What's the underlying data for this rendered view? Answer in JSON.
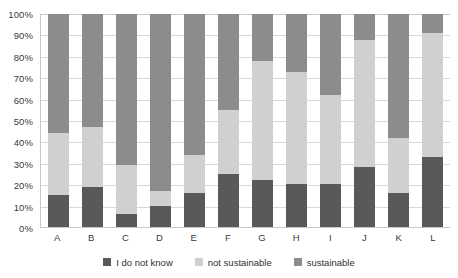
{
  "chart_data": {
    "type": "bar",
    "subtype": "stacked-percentage-bar",
    "title": "",
    "subtitle": "",
    "xlabel": "",
    "ylabel": "",
    "ylim": [
      0,
      100
    ],
    "grid": true,
    "legend_position": "bottom",
    "categories": [
      "A",
      "B",
      "C",
      "D",
      "E",
      "F",
      "G",
      "H",
      "I",
      "J",
      "K",
      "L"
    ],
    "y_ticks": [
      "0%",
      "10%",
      "20%",
      "30%",
      "40%",
      "50%",
      "60%",
      "70%",
      "80%",
      "90%",
      "100%"
    ],
    "y_tick_values": [
      0,
      10,
      20,
      30,
      40,
      50,
      60,
      70,
      80,
      90,
      100
    ],
    "series": [
      {
        "name": "I do not know",
        "color": "#595959",
        "values": [
          15,
          19,
          6,
          10,
          16,
          25,
          22,
          20,
          20,
          28,
          16,
          33
        ]
      },
      {
        "name": "not sustainable",
        "color": "#d0d0d0",
        "values": [
          29,
          28,
          23,
          7,
          18,
          30,
          56,
          53,
          42,
          60,
          26,
          58
        ]
      },
      {
        "name": "sustainable",
        "color": "#8c8c8c",
        "values": [
          56,
          53,
          71,
          83,
          66,
          45,
          22,
          27,
          38,
          12,
          58,
          9
        ]
      }
    ],
    "cumulative_boundaries": {
      "A": [
        15,
        44,
        100
      ],
      "B": [
        19,
        47,
        100
      ],
      "C": [
        6,
        29,
        100
      ],
      "D": [
        10,
        17,
        100
      ],
      "E": [
        16,
        34,
        100
      ],
      "F": [
        25,
        55,
        100
      ],
      "G": [
        22,
        78,
        100
      ],
      "H": [
        20,
        73,
        100
      ],
      "I": [
        20,
        62,
        100
      ],
      "J": [
        28,
        88,
        100
      ],
      "K": [
        16,
        42,
        100
      ],
      "L": [
        33,
        91,
        100
      ]
    }
  },
  "legend": {
    "items": [
      {
        "label": "I do not know",
        "color": "#595959"
      },
      {
        "label": "not sustainable",
        "color": "#d0d0d0"
      },
      {
        "label": "sustainable",
        "color": "#8c8c8c"
      }
    ]
  }
}
